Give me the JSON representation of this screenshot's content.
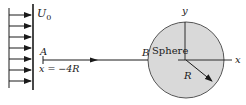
{
  "diagram": {
    "type": "flow-past-sphere",
    "colors": {
      "line": "#1a1a1a",
      "sphere_fill": "#d9d9d9",
      "sphere_stroke": "#555555",
      "background": "#ffffff"
    },
    "uniform_flow": {
      "label": "U",
      "subscript": "0",
      "arrow_count": 7
    },
    "point_a": {
      "label": "A",
      "position_label": "x = −4R"
    },
    "point_b": {
      "label": "B"
    },
    "sphere": {
      "label": "Sphere",
      "radius_label": "R"
    },
    "axes": {
      "x_label": "x",
      "y_label": "y"
    }
  }
}
